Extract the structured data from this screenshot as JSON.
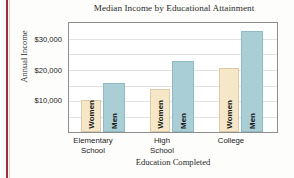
{
  "chart_data": {
    "type": "bar",
    "title": "Median Income by Educational Attainment",
    "xlabel": "Education Completed",
    "ylabel": "Annual Income",
    "categories": [
      "Elementary School",
      "High School",
      "College"
    ],
    "category_lines": [
      [
        "Elementary",
        "School"
      ],
      [
        "High",
        "School"
      ],
      [
        "College"
      ]
    ],
    "series": [
      {
        "name": "Women",
        "values": [
          10500,
          14000,
          21000
        ],
        "color": "#f5e7c8"
      },
      {
        "name": "Men",
        "values": [
          16000,
          23000,
          33000
        ],
        "color": "#a9ced5"
      }
    ],
    "ylim": [
      0,
      35500
    ],
    "yticks": [
      10000,
      20000,
      30000
    ],
    "ytick_labels": [
      "$10,000",
      "$20,000",
      "$30,000"
    ],
    "gridlines": [
      5000,
      10000,
      15000,
      20000,
      25000,
      30000,
      35000
    ],
    "grid": true,
    "legend": "in-bar",
    "bar_labels": [
      "Women",
      "Men",
      "Women",
      "Men",
      "Women",
      "Men"
    ],
    "axis_border_color": "#8d8d8d",
    "grid_color": "#e2e2e2",
    "accent_rule_color": "#9e2f3a"
  }
}
